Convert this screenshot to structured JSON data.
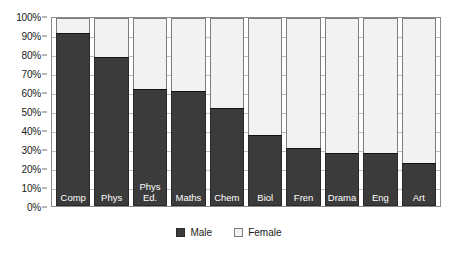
{
  "chart_data": {
    "type": "bar",
    "subtype": "100% stacked bar",
    "title": "",
    "subtitle": "",
    "xlabel": "",
    "ylabel": "",
    "ylim": [
      0,
      100
    ],
    "y_tick_labels": [
      "100%",
      "90%",
      "80%",
      "70%",
      "60%",
      "50%",
      "40%",
      "30%",
      "20%",
      "10%",
      "0%"
    ],
    "y_tick_values": [
      100,
      90,
      80,
      70,
      60,
      50,
      40,
      30,
      20,
      10,
      0
    ],
    "grid": true,
    "legend_position": "bottom-center",
    "categories": [
      "Comp",
      "Phys",
      "Phys Ed.",
      "Maths",
      "Chem",
      "Biol",
      "Fren",
      "Drama",
      "Eng",
      "Art"
    ],
    "series": [
      {
        "name": "Male",
        "color": "#3b3b3b",
        "values": [
          92,
          79,
          62,
          61,
          52,
          38,
          31,
          28,
          28,
          23
        ]
      },
      {
        "name": "Female",
        "color": "#f2f2f2",
        "values": [
          8,
          21,
          38,
          39,
          48,
          62,
          69,
          72,
          72,
          77
        ]
      }
    ]
  },
  "legend": {
    "entries": [
      {
        "label": "Male",
        "swatch": "male"
      },
      {
        "label": "Female",
        "swatch": "female"
      }
    ]
  },
  "colors": {
    "male": "#3b3b3b",
    "female": "#f2f2f2",
    "axis": "#8a8a8a",
    "gridline": "#bdbdbd",
    "text": "#1a1a1a",
    "bar_label_text": "#ffffff",
    "background": "#ffffff"
  }
}
